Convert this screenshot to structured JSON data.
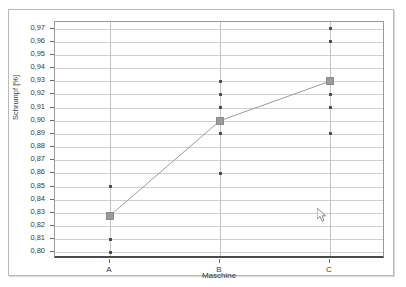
{
  "window": {
    "title": "Main Effects Plot"
  },
  "chart_data": {
    "type": "scatter",
    "title": "",
    "xlabel": "Maschine",
    "ylabel": "Schrumpf [%]",
    "categories": [
      "A",
      "B",
      "C"
    ],
    "ylim": [
      0.795,
      0.975
    ],
    "yticks": [
      0.8,
      0.81,
      0.82,
      0.83,
      0.84,
      0.85,
      0.86,
      0.87,
      0.88,
      0.89,
      0.9,
      0.91,
      0.92,
      0.93,
      0.94,
      0.95,
      0.96,
      0.97
    ],
    "ytick_labels": [
      "0,80",
      "0,81",
      "0,82",
      "0,83",
      "0,84",
      "0,85",
      "0,86",
      "0,87",
      "0,88",
      "0,89",
      "0,90",
      "0,91",
      "0,92",
      "0,93",
      "0,94",
      "0,95",
      "0,96",
      "0,97"
    ],
    "grid": true,
    "legend": null,
    "series": [
      {
        "name": "Einzelwerte",
        "marker": "dot",
        "color": "#4d4d4d",
        "points": [
          {
            "category": "A",
            "value": 0.85
          },
          {
            "category": "A",
            "value": 0.81
          },
          {
            "category": "A",
            "value": 0.8
          },
          {
            "category": "B",
            "value": 0.93
          },
          {
            "category": "B",
            "value": 0.92
          },
          {
            "category": "B",
            "value": 0.91
          },
          {
            "category": "B",
            "value": 0.89
          },
          {
            "category": "B",
            "value": 0.86
          },
          {
            "category": "C",
            "value": 0.97
          },
          {
            "category": "C",
            "value": 0.96
          },
          {
            "category": "C",
            "value": 0.92
          },
          {
            "category": "C",
            "value": 0.91
          },
          {
            "category": "C",
            "value": 0.89
          }
        ]
      },
      {
        "name": "Mittelwert",
        "marker": "square",
        "color": "#9b9b9b",
        "connected": true,
        "values": [
          0.828,
          0.9,
          0.93
        ]
      }
    ]
  },
  "cursor": {
    "icon": "mouse-pointer-icon",
    "x": 308,
    "y": 198
  },
  "colors": {
    "grid": "#cfcfcf",
    "category_line": "#c4c4c4",
    "axis": "#4a4a4a",
    "point": "#4d4d4d",
    "mean": "#9b9b9b",
    "panel_border": "#b9b9b9"
  }
}
